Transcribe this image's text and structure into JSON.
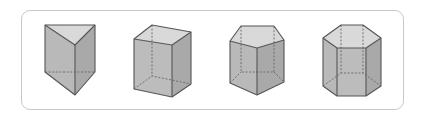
{
  "figure": {
    "shapes": [
      {
        "name": "triangular-prism",
        "base_sides": 3
      },
      {
        "name": "rectangular-prism",
        "base_sides": 4
      },
      {
        "name": "pentagonal-prism",
        "base_sides": 5
      },
      {
        "name": "hexagonal-prism",
        "base_sides": 6
      }
    ],
    "colors": {
      "frame_border": "#c9c9c9",
      "face_light": "#d9d9d9",
      "face_mid": "#b9b9b9",
      "face_dark": "#a9a9a9",
      "edge": "#555555"
    }
  }
}
